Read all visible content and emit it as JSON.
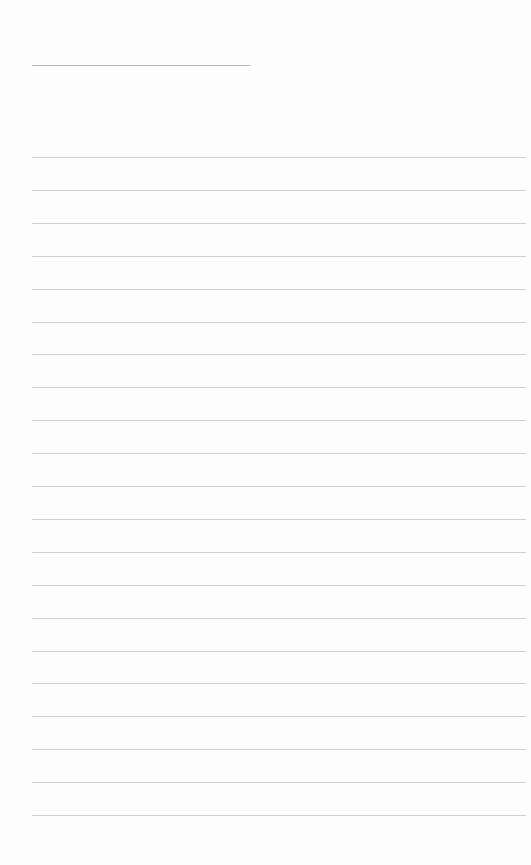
{
  "document": {
    "type": "lined-paper",
    "title_line": {
      "left": 32,
      "top": 65,
      "width": 218
    },
    "rules": {
      "left": 32,
      "width": 494,
      "first_top": 157,
      "spacing": 32.9,
      "count": 21
    },
    "colors": {
      "background": "#fefefe",
      "rule": "#cfcfcf",
      "title_rule": "#b8b8b8"
    }
  }
}
